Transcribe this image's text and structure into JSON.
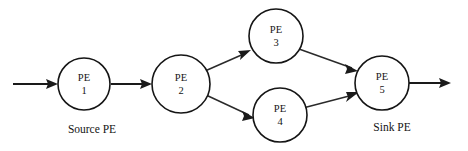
{
  "figure": {
    "background_color": "#ffffff",
    "stroke_color": "#1a1a1a",
    "width": 468,
    "height": 151
  },
  "nodes": [
    {
      "id": "pe1",
      "label_line1": "PE",
      "label_line2": "1",
      "cx": 84,
      "cy": 84,
      "r": 26,
      "role": "source"
    },
    {
      "id": "pe2",
      "label_line1": "PE",
      "label_line2": "2",
      "cx": 181,
      "cy": 84,
      "r": 29,
      "role": "intermediate"
    },
    {
      "id": "pe3",
      "label_line1": "PE",
      "label_line2": "3",
      "cx": 276,
      "cy": 36,
      "r": 27,
      "role": "intermediate"
    },
    {
      "id": "pe4",
      "label_line1": "PE",
      "label_line2": "4",
      "cx": 280,
      "cy": 115,
      "r": 27,
      "role": "intermediate"
    },
    {
      "id": "pe5",
      "label_line1": "PE",
      "label_line2": "5",
      "cx": 382,
      "cy": 83,
      "r": 27,
      "role": "sink"
    }
  ],
  "captions": [
    {
      "id": "source-caption",
      "text": "Source PE",
      "x": 92,
      "y": 130
    },
    {
      "id": "sink-caption",
      "text": "Sink PE",
      "x": 392,
      "y": 128
    }
  ],
  "edges": [
    {
      "id": "input-arrow",
      "from": "external-input",
      "to": "pe1",
      "x1": 13,
      "y1": 84,
      "x2": 57,
      "y2": 84,
      "weight": "thick"
    },
    {
      "id": "pe1-pe2",
      "from": "pe1",
      "to": "pe2",
      "x1": 111,
      "y1": 84,
      "x2": 151,
      "y2": 84,
      "weight": "thick"
    },
    {
      "id": "pe2-pe3",
      "from": "pe2",
      "to": "pe3",
      "x1": 205,
      "y1": 71,
      "x2": 250,
      "y2": 51,
      "weight": "thin"
    },
    {
      "id": "pe2-pe4",
      "from": "pe2",
      "to": "pe4",
      "x1": 206,
      "y1": 95,
      "x2": 254,
      "y2": 117,
      "weight": "thin"
    },
    {
      "id": "pe3-pe5",
      "from": "pe3",
      "to": "pe5",
      "x1": 299,
      "y1": 49,
      "x2": 357,
      "y2": 70,
      "weight": "thin"
    },
    {
      "id": "pe4-pe5",
      "from": "pe4",
      "to": "pe5",
      "x1": 303,
      "y1": 108,
      "x2": 357,
      "y2": 93,
      "weight": "thin"
    },
    {
      "id": "output-arrow",
      "from": "pe5",
      "to": "external-output",
      "x1": 409,
      "y1": 83,
      "x2": 450,
      "y2": 83,
      "weight": "thick"
    }
  ]
}
